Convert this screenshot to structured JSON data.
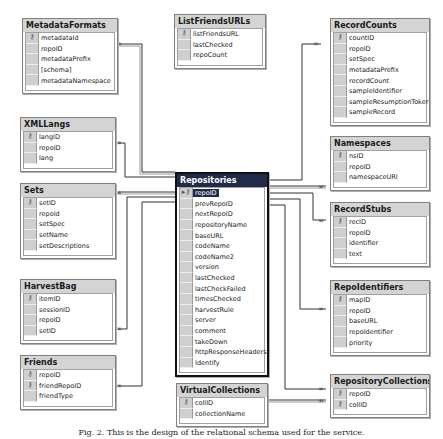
{
  "tables": {
    "metadataFormats": {
      "title": "MetadataFormats",
      "columns": [
        {
          "name": "metadataId",
          "key": true
        },
        {
          "name": "repoID",
          "key": false
        },
        {
          "name": "metadataPrefix",
          "key": false
        },
        {
          "name": "[schema]",
          "key": false
        },
        {
          "name": "metadataNamespace",
          "key": false
        }
      ]
    },
    "listFriendsURLs": {
      "title": "ListFriendsURLs",
      "columns": [
        {
          "name": "listFriendsURL",
          "key": true
        },
        {
          "name": "lastChecked",
          "key": false
        },
        {
          "name": "repoCount",
          "key": false
        }
      ]
    },
    "recordCounts": {
      "title": "RecordCounts",
      "columns": [
        {
          "name": "countID",
          "key": true
        },
        {
          "name": "repoID",
          "key": false
        },
        {
          "name": "setSpec",
          "key": false
        },
        {
          "name": "metadataPrefix",
          "key": false
        },
        {
          "name": "recordCount",
          "key": false
        },
        {
          "name": "sampleIdentifier",
          "key": false
        },
        {
          "name": "sampleResumptionToker",
          "key": false
        },
        {
          "name": "sampleRecord",
          "key": false
        }
      ]
    },
    "xmlLangs": {
      "title": "XMLLangs",
      "columns": [
        {
          "name": "langID",
          "key": true
        },
        {
          "name": "repoID",
          "key": false
        },
        {
          "name": "lang",
          "key": false
        }
      ]
    },
    "sets": {
      "title": "Sets",
      "columns": [
        {
          "name": "setID",
          "key": true
        },
        {
          "name": "repoId",
          "key": false
        },
        {
          "name": "setSpec",
          "key": false
        },
        {
          "name": "setName",
          "key": false
        },
        {
          "name": "setDescriptions",
          "key": false
        }
      ]
    },
    "harvestBag": {
      "title": "HarvestBag",
      "columns": [
        {
          "name": "itemID",
          "key": true
        },
        {
          "name": "sessionID",
          "key": false
        },
        {
          "name": "repoID",
          "key": false
        },
        {
          "name": "setID",
          "key": false
        }
      ]
    },
    "friends": {
      "title": "Friends",
      "columns": [
        {
          "name": "repoID",
          "key": true
        },
        {
          "name": "friendRepoID",
          "key": true
        },
        {
          "name": "friendType",
          "key": false
        }
      ]
    },
    "repositories": {
      "title": "Repositories",
      "columns": [
        {
          "name": "repoID",
          "key": true,
          "selected": true
        },
        {
          "name": "prevRepoID",
          "key": false
        },
        {
          "name": "nextRepoID",
          "key": false
        },
        {
          "name": "repositoryName",
          "key": false
        },
        {
          "name": "baseURL",
          "key": false
        },
        {
          "name": "codeName",
          "key": false
        },
        {
          "name": "codeName2",
          "key": false
        },
        {
          "name": "version",
          "key": false
        },
        {
          "name": "lastChecked",
          "key": false
        },
        {
          "name": "lastCheckFailed",
          "key": false
        },
        {
          "name": "timesChecked",
          "key": false
        },
        {
          "name": "harvestRule",
          "key": false
        },
        {
          "name": "server",
          "key": false
        },
        {
          "name": "comment",
          "key": false
        },
        {
          "name": "takeDown",
          "key": false
        },
        {
          "name": "httpResponseHeaders",
          "key": false
        },
        {
          "name": "Identify",
          "key": false
        }
      ]
    },
    "namespaces": {
      "title": "Namespaces",
      "columns": [
        {
          "name": "nsID",
          "key": true
        },
        {
          "name": "repoID",
          "key": false
        },
        {
          "name": "namespaceURI",
          "key": false
        }
      ]
    },
    "recordStubs": {
      "title": "RecordStubs",
      "columns": [
        {
          "name": "recID",
          "key": true
        },
        {
          "name": "repoID",
          "key": false
        },
        {
          "name": "identifier",
          "key": false
        },
        {
          "name": "text",
          "key": false
        }
      ]
    },
    "repoIdentifiers": {
      "title": "RepoIdentifiers",
      "columns": [
        {
          "name": "mapID",
          "key": true
        },
        {
          "name": "repoID",
          "key": false
        },
        {
          "name": "baseURL",
          "key": false
        },
        {
          "name": "repoIdentifier",
          "key": false
        },
        {
          "name": "priority",
          "key": false
        }
      ]
    },
    "repositoryCollections": {
      "title": "RepositoryCollections",
      "columns": [
        {
          "name": "repoID",
          "key": true
        },
        {
          "name": "collID",
          "key": true
        }
      ]
    },
    "virtualCollections": {
      "title": "VirtualCollections",
      "columns": [
        {
          "name": "collID",
          "key": true
        },
        {
          "name": "collectionName",
          "key": false
        }
      ]
    }
  },
  "relationships": [
    {
      "from": "MetadataFormats",
      "to": "Repositories",
      "cardinality": "many-to-one"
    },
    {
      "from": "XMLLangs",
      "to": "Repositories",
      "cardinality": "many-to-one"
    },
    {
      "from": "Sets",
      "to": "Repositories",
      "cardinality": "many-to-one"
    },
    {
      "from": "HarvestBag",
      "to": "Repositories",
      "cardinality": "many-to-one"
    },
    {
      "from": "Friends",
      "to": "Repositories",
      "cardinality": "many-to-one"
    },
    {
      "from": "RecordCounts",
      "to": "Repositories",
      "cardinality": "many-to-one"
    },
    {
      "from": "Namespaces",
      "to": "Repositories",
      "cardinality": "many-to-one"
    },
    {
      "from": "RecordStubs",
      "to": "Repositories",
      "cardinality": "many-to-one"
    },
    {
      "from": "RepoIdentifiers",
      "to": "Repositories",
      "cardinality": "many-to-one"
    },
    {
      "from": "RepositoryCollections",
      "to": "Repositories",
      "cardinality": "many-to-one"
    },
    {
      "from": "RepositoryCollections",
      "to": "VirtualCollections",
      "cardinality": "many-to-one"
    }
  ],
  "caption": "Fig. 2. This is the design of the relational schema used for the service."
}
